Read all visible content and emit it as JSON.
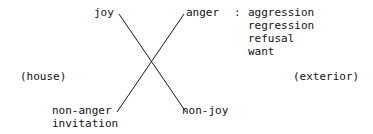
{
  "diagram": {
    "type": "semiotic-square",
    "background_color": "#ffffff",
    "line_color": "#1a1a1a",
    "text_color": "#111111",
    "terms": {
      "top_left": "joy",
      "top_right": "anger",
      "bottom_left": "non-anger",
      "bottom_right": "non-joy"
    },
    "sub_labels": {
      "bottom_left_sub": "invitation"
    },
    "separator": ":",
    "anger_expansion": [
      "aggression",
      "regression",
      "refusal",
      "want"
    ],
    "context_labels": {
      "left": "(house)",
      "right": "(exterior)"
    },
    "axes": [
      {
        "name": "joy-to-non-joy",
        "from": "joy",
        "to": "non-joy",
        "x1": 119,
        "y1": 14,
        "x2": 186,
        "y2": 112
      },
      {
        "name": "anger-to-non-anger",
        "from": "anger",
        "to": "non-anger",
        "x1": 184,
        "y1": 14,
        "x2": 117,
        "y2": 112
      }
    ],
    "crossing_point": {
      "x": 152,
      "y": 63
    }
  }
}
